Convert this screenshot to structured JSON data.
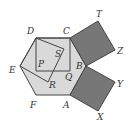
{
  "diagram": {
    "title": "",
    "colors": {
      "hexagon_fill": "#d9d9d9",
      "square_fill": "#777777",
      "stroke": "#444444",
      "background": "#ffffff"
    },
    "points": {
      "A": {
        "x": 70,
        "y": 95
      },
      "B": {
        "x": 86,
        "y": 66
      },
      "C": {
        "x": 70,
        "y": 38
      },
      "D": {
        "x": 36,
        "y": 38
      },
      "E": {
        "x": 20,
        "y": 66
      },
      "F": {
        "x": 36,
        "y": 95
      },
      "T": {
        "x": 98,
        "y": 21
      },
      "Z": {
        "x": 115,
        "y": 50
      },
      "Y": {
        "x": 115,
        "y": 82
      },
      "X": {
        "x": 98,
        "y": 111
      },
      "P": {
        "x": 36,
        "y": 71
      },
      "Q": {
        "x": 70,
        "y": 71
      },
      "S": {
        "x": 64,
        "y": 49
      },
      "R": {
        "x": 48,
        "y": 82
      }
    },
    "shapes": [
      {
        "name": "hexagon-ABCDEF",
        "type": "hexagon",
        "vertices": [
          "A",
          "B",
          "C",
          "D",
          "E",
          "F"
        ]
      },
      {
        "name": "square-CTZB",
        "type": "square",
        "vertices": [
          "C",
          "T",
          "Z",
          "B"
        ]
      },
      {
        "name": "square-BYXA",
        "type": "square",
        "vertices": [
          "B",
          "Y",
          "X",
          "A"
        ]
      },
      {
        "name": "square-DCQP",
        "type": "square",
        "vertices": [
          "D",
          "C",
          "Q",
          "P"
        ]
      },
      {
        "name": "square-DSRE",
        "type": "square",
        "vertices": [
          "D",
          "S",
          "R",
          "E"
        ]
      }
    ],
    "labels": [
      {
        "text": "D",
        "x": 27,
        "y": 27
      },
      {
        "text": "C",
        "x": 63,
        "y": 27
      },
      {
        "text": "T",
        "x": 96,
        "y": 10
      },
      {
        "text": "Z",
        "x": 117,
        "y": 47
      },
      {
        "text": "S",
        "x": 55,
        "y": 50
      },
      {
        "text": "P",
        "x": 38,
        "y": 60
      },
      {
        "text": "B",
        "x": 76,
        "y": 62
      },
      {
        "text": "E",
        "x": 9,
        "y": 66
      },
      {
        "text": "Q",
        "x": 65,
        "y": 73
      },
      {
        "text": "R",
        "x": 49,
        "y": 81
      },
      {
        "text": "Y",
        "x": 117,
        "y": 80
      },
      {
        "text": "F",
        "x": 30,
        "y": 101
      },
      {
        "text": "A",
        "x": 63,
        "y": 101
      },
      {
        "text": "X",
        "x": 97,
        "y": 113
      }
    ]
  }
}
